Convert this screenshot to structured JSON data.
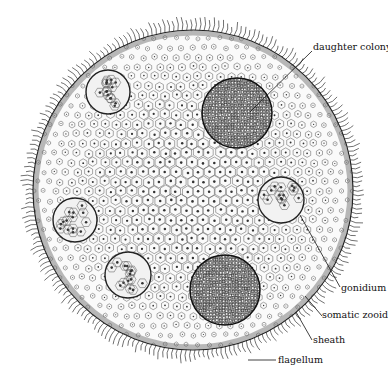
{
  "diagram": {
    "colony": {
      "cx": 193,
      "cy": 190,
      "r": 160
    },
    "inclusions": [
      {
        "type": "gonidium",
        "cx": 108,
        "cy": 92,
        "r": 22
      },
      {
        "type": "gonidium",
        "cx": 75,
        "cy": 220,
        "r": 22
      },
      {
        "type": "gonidium",
        "cx": 128,
        "cy": 275,
        "r": 23
      },
      {
        "type": "gonidium",
        "cx": 281,
        "cy": 200,
        "r": 23
      },
      {
        "type": "daughter-colony",
        "cx": 237,
        "cy": 113,
        "r": 35
      },
      {
        "type": "daughter-colony",
        "cx": 225,
        "cy": 290,
        "r": 35
      }
    ],
    "labels": [
      {
        "key": "daughter_colony",
        "text": "daughter colony",
        "x": 313,
        "y": 47,
        "line": [
          312,
          51,
          250,
          112
        ]
      },
      {
        "key": "gonidium",
        "text": "gonidium",
        "x": 341,
        "y": 284,
        "line": [
          340,
          287,
          300,
          215
        ]
      },
      {
        "key": "somatic_zooid",
        "text": "somatic zooid",
        "x": 322,
        "y": 312,
        "line": [
          322,
          316,
          305,
          296
        ]
      },
      {
        "key": "sheath",
        "text": "sheath",
        "x": 313,
        "y": 336,
        "line": [
          312,
          340,
          296,
          312
        ]
      },
      {
        "key": "flagellum",
        "text": "flagellum",
        "x": 278,
        "y": 356,
        "line": [
          276,
          360,
          248,
          360
        ]
      }
    ]
  },
  "labels_text": {
    "daughter_colony": "daughter colony",
    "gonidium": "gonidium",
    "somatic_zooid": "somatic zooid",
    "sheath": "sheath",
    "flagellum": "flagellum"
  }
}
